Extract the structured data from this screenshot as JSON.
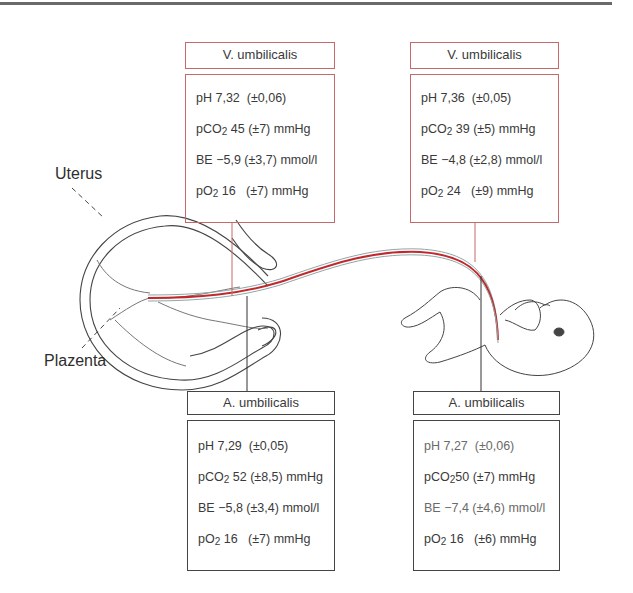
{
  "labels": {
    "uterus": "Uterus",
    "placenta": "Plazenta"
  },
  "boxes": [
    {
      "id": "top-left",
      "title": "V. umbilicalis",
      "vessel": "vein",
      "rows": [
        {
          "param": "pH",
          "sub": "",
          "value": "7,32",
          "sd": "(±0,06)",
          "unit": ""
        },
        {
          "param": "pCO",
          "sub": "2",
          "value": "45",
          "sd": "(±7)",
          "unit": "mmHg"
        },
        {
          "param": "BE",
          "sub": "",
          "value": "−5,9",
          "sd": "(±3,7)",
          "unit": "mmol/l"
        },
        {
          "param": "pO",
          "sub": "2",
          "value": "16",
          "sd": "(±7)",
          "unit": "mmHg"
        }
      ]
    },
    {
      "id": "top-right",
      "title": "V. umbilicalis",
      "vessel": "vein",
      "rows": [
        {
          "param": "pH",
          "sub": "",
          "value": "7,36",
          "sd": "(±0,05)",
          "unit": ""
        },
        {
          "param": "pCO",
          "sub": "2",
          "value": "39",
          "sd": "(±5)",
          "unit": "mmHg"
        },
        {
          "param": "BE",
          "sub": "",
          "value": "−4,8",
          "sd": "(±2,8)",
          "unit": "mmol/l"
        },
        {
          "param": "pO",
          "sub": "2",
          "value": "24",
          "sd": "(±9)",
          "unit": "mmHg"
        }
      ]
    },
    {
      "id": "bottom-left",
      "title": "A. umbilicalis",
      "vessel": "artery",
      "rows": [
        {
          "param": "pH",
          "sub": "",
          "value": "7,29",
          "sd": "(±0,05)",
          "unit": ""
        },
        {
          "param": "pCO",
          "sub": "2",
          "value": "52",
          "sd": "(±8,5)",
          "unit": "mmHg"
        },
        {
          "param": "BE",
          "sub": "",
          "value": "−5,8",
          "sd": "(±3,4)",
          "unit": "mmol/l"
        },
        {
          "param": "pO",
          "sub": "2",
          "value": "16",
          "sd": "(±7)",
          "unit": "mmHg"
        }
      ]
    },
    {
      "id": "bottom-right",
      "title": "A. umbilicalis",
      "vessel": "artery",
      "rows": [
        {
          "param": "pH",
          "sub": "",
          "value": "7,27",
          "sd": "(±0,06)",
          "unit": ""
        },
        {
          "param": "pCO",
          "sub": "2",
          "value": "50",
          "sd": "(±7)",
          "unit": "mmHg"
        },
        {
          "param": "BE",
          "sub": "",
          "value": "−7,4",
          "sd": "(±4,6)",
          "unit": "mmol/l"
        },
        {
          "param": "pO",
          "sub": "2",
          "value": "16",
          "sd": "(±6)",
          "unit": "mmHg"
        }
      ]
    }
  ],
  "colors": {
    "vein_border": "#c46a6a",
    "artery_border": "#444444",
    "cord_red": "#c0282d",
    "cord_outline": "#8fa7a6"
  }
}
